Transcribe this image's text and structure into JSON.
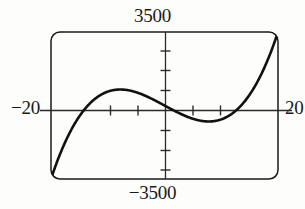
{
  "graph": {
    "title_top_label": "3500",
    "bottom_label": "−3500",
    "left_label": "−20",
    "right_label": "20"
  },
  "chart_data": {
    "type": "line",
    "title": "",
    "xlabel": "",
    "ylabel": "",
    "xlim": [
      -20,
      20
    ],
    "ylim": [
      -3500,
      3500
    ],
    "grid": false,
    "legend": null,
    "axis_style": "calculator-window-with-rounded-frame",
    "xticks": [
      -15,
      -10,
      -5,
      0,
      5,
      10,
      15
    ],
    "xtick_labels": [
      "",
      "",
      "",
      "",
      "",
      "",
      ""
    ],
    "yticks": [
      -2625,
      -1750,
      -875,
      0,
      875,
      1750,
      2625
    ],
    "ytick_labels": [
      "",
      "",
      "",
      "",
      "",
      "",
      ""
    ],
    "x_axis_tick_count_left": 2,
    "x_axis_tick_count_right": 2,
    "y_axis_tick_count_above": 3,
    "y_axis_tick_count_below": 3,
    "annotations": [
      {
        "label": "local-maximum",
        "x": -7.0,
        "y": 1150
      },
      {
        "label": "local-minimum",
        "x": 7.0,
        "y": -1150
      },
      {
        "label": "root-left",
        "x": -13.5,
        "y": 0
      },
      {
        "label": "root-center",
        "x": 0.0,
        "y": 0
      },
      {
        "label": "root-right",
        "x": 13.5,
        "y": 0
      }
    ],
    "series": [
      {
        "name": "cubic",
        "color": "#111111",
        "linewidth": 2.6,
        "x": [
          -19.4,
          -19.0,
          -18.5,
          -18.0,
          -17.5,
          -17.0,
          -16.5,
          -16.0,
          -15.5,
          -15.0,
          -14.5,
          -14.0,
          -13.5,
          -13.0,
          -12.5,
          -12.0,
          -11.5,
          -11.0,
          -10.5,
          -10.0,
          -9.5,
          -9.0,
          -8.5,
          -8.0,
          -7.5,
          -7.0,
          -6.5,
          -6.0,
          -5.5,
          -5.0,
          -4.5,
          -4.0,
          -3.5,
          -3.0,
          -2.5,
          -2.0,
          -1.5,
          -1.0,
          -0.5,
          0.0,
          0.5,
          1.0,
          1.5,
          2.0,
          2.5,
          3.0,
          3.5,
          4.0,
          4.5,
          5.0,
          5.5,
          6.0,
          6.5,
          7.0,
          7.5,
          8.0,
          8.5,
          9.0,
          9.5,
          10.0,
          10.5,
          11.0,
          11.5,
          12.0,
          12.5,
          13.0,
          13.5,
          14.0,
          14.5,
          15.0,
          15.5,
          16.0,
          16.5,
          17.0,
          17.5,
          18.0,
          18.5,
          19.0,
          19.4
        ],
        "y": [
          -3500,
          -3173,
          -2790,
          -2430,
          -2093,
          -1779,
          -1487,
          -1216,
          -966,
          -735,
          -524,
          -332,
          -157,
          0,
          142,
          270,
          384,
          485,
          574,
          653,
          721,
          780,
          830,
          872,
          907,
          934,
          955,
          970,
          979,
          983,
          982,
          976,
          966,
          952,
          934,
          912,
          886,
          856,
          822,
          0,
          -822,
          -856,
          -886,
          -912,
          -934,
          -952,
          -966,
          -976,
          -982,
          -983,
          -979,
          -970,
          -955,
          -934,
          -907,
          -872,
          -830,
          -780,
          -721,
          -653,
          -574,
          -485,
          -384,
          -270,
          -142,
          0,
          157,
          332,
          524,
          735,
          966,
          1216,
          1487,
          1779,
          2093,
          2430,
          2790,
          3173,
          3500
        ],
        "note": "odd cubic-like curve: rises from bottom-left corner, local max left of origin, crosses origin, local min right of origin, exits top-right corner"
      }
    ]
  }
}
